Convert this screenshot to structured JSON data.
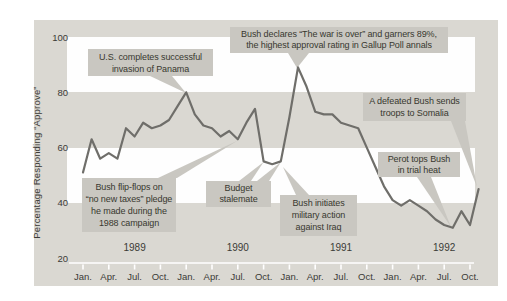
{
  "chart_data": {
    "type": "line",
    "title": "",
    "ylabel": "Percentage Responding “Approve”",
    "ylim": [
      20,
      100
    ],
    "y_tick_labels": [
      "100",
      "80",
      "60",
      "40",
      "20"
    ],
    "x_start": "Jan 1989",
    "x_interval": "monthly",
    "x_tick_labels": [
      "Jan.",
      "Apr.",
      "Jul.",
      "Oct.",
      "Jan.",
      "Apr.",
      "Jul.",
      "Oct.",
      "Jan.",
      "Apr.",
      "Jul.",
      "Oct.",
      "Jan.",
      "Apr.",
      "Jul.",
      "Oct."
    ],
    "year_labels": [
      "1989",
      "1990",
      "1991",
      "1992"
    ],
    "legend": "none",
    "grid": "alternating white/gray horizontal bands every 20 units",
    "values": [
      51,
      63,
      56,
      58,
      56,
      67,
      64,
      69,
      67,
      68,
      70,
      75,
      80,
      72,
      68,
      67,
      64,
      66,
      63,
      69,
      74,
      55,
      54,
      55,
      71,
      89,
      82,
      73,
      72,
      72,
      69,
      68,
      67,
      60,
      53,
      46,
      41,
      39,
      41,
      39,
      37,
      34,
      32,
      31,
      37,
      32,
      45
    ],
    "annotations": [
      {
        "lines": [
          "U.S. completes successful",
          "invasion of Panama"
        ]
      },
      {
        "lines": [
          "Bush declares “The war is over” and garners 89%,",
          "the highest approval rating in Gallup Poll annals"
        ]
      },
      {
        "lines": [
          "Bush flip-flops on",
          "“no new taxes” pledge",
          "he made during the",
          "1988 campaign"
        ]
      },
      {
        "lines": [
          "Budget",
          "stalemate"
        ]
      },
      {
        "lines": [
          "Bush initiates",
          "military action",
          "against Iraq"
        ]
      },
      {
        "lines": [
          "A defeated Bush sends",
          "troops to Somalia"
        ]
      },
      {
        "lines": [
          "Perot tops Bush",
          "in trial heat"
        ]
      }
    ]
  },
  "colors": {
    "panel_bg": "#dad8d2",
    "band": "#fefefe",
    "annotation_bg": "#c9c7c1",
    "line": "#6f6e6a",
    "axis_line": "#ffffff",
    "text": "#3b3b37"
  }
}
